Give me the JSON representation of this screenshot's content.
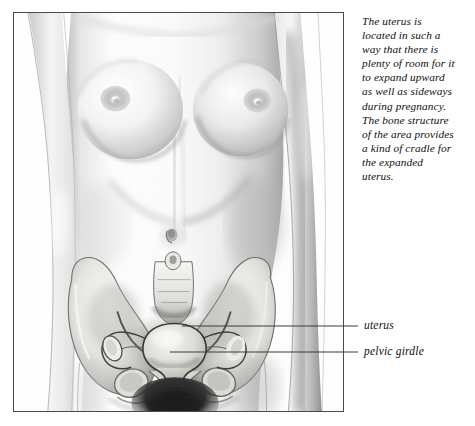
{
  "page": {
    "background_color": "#ffffff",
    "width": 475,
    "height": 426
  },
  "plate": {
    "frame_color": "#4a4a4a",
    "title": "female-torso-pelvis-anatomy-illustration",
    "medium": "pencil-drawing",
    "subject": "frontal view of female torso with pelvic girdle and uterus overlay"
  },
  "caption": {
    "text": "The uterus is\nlocated in such a\nway that there is\nplenty of room for it\nto expand upward\nas well as sideways\nduring pregnancy.\nThe bone structure\nof the area provides\na kind of cradle for\nthe expanded\nuterus."
  },
  "callouts": [
    {
      "id": "uterus",
      "label": "uterus",
      "leader_from_x": 182,
      "leader_from_y": 326,
      "leader_to_x": 358,
      "leader_to_y": 326
    },
    {
      "id": "pelvic-girdle",
      "label": "pelvic girdle",
      "leader_from_x": 170,
      "leader_from_y": 352,
      "leader_to_x": 358,
      "leader_to_y": 352
    }
  ],
  "colors": {
    "ink": "#101010",
    "leader_line": "#3a3a3a",
    "frame": "#4a4a4a",
    "skin_light": "#fbfbfb",
    "skin_mid": "#dcdcdc",
    "skin_shadow": "#9a9a9a",
    "bone_light": "#f2f2f0",
    "bone_mid": "#cfcfcb",
    "bone_dark": "#8f8f8b",
    "organ_outline": "#2e2e2e",
    "pubic_shadow": "#2a2a2a"
  }
}
